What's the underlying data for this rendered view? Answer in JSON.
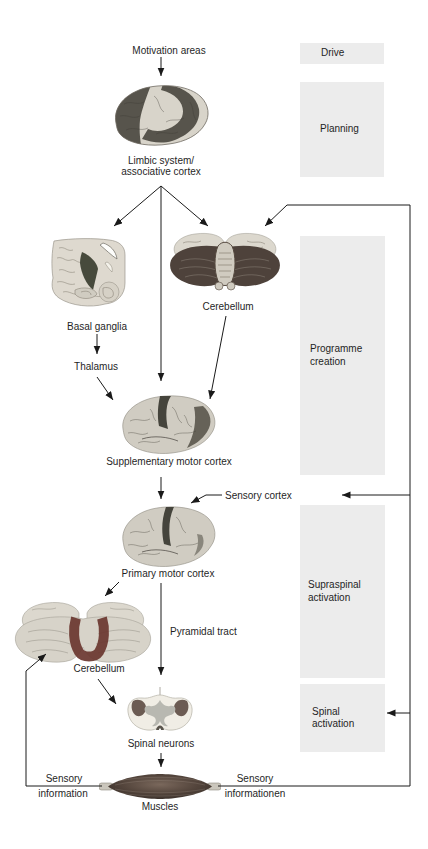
{
  "figure": {
    "stages": [
      {
        "id": "drive",
        "label": "Drive"
      },
      {
        "id": "planning",
        "label": "Planning"
      },
      {
        "id": "programme-creation",
        "label": "Programme\ncreation"
      },
      {
        "id": "supraspinal-activation",
        "label": "Supraspinal\nactivation"
      },
      {
        "id": "spinal-activation",
        "label": "Spinal\nactivation"
      }
    ],
    "labels": {
      "motivation_areas": "Motivation areas",
      "limbic": "Limbic system/\nassociative cortex",
      "basal_ganglia": "Basal ganglia",
      "thalamus": "Thalamus",
      "cerebellum_upper": "Cerebellum",
      "supplementary_motor_cortex": "Supplementary motor cortex",
      "sensory_cortex": "Sensory cortex",
      "primary_motor_cortex": "Primary motor cortex",
      "pyramidal_tract": "Pyramidal tract",
      "cerebellum_lower": "Cerebellum",
      "spinal_neurons": "Spinal neurons",
      "muscles": "Muscles",
      "sensory_left_line1": "Sensory",
      "sensory_left_line2": "information",
      "sensory_right_line1": "Sensory",
      "sensory_right_line2": "informationen"
    },
    "icons": [
      "limbic-brain-image",
      "basal-ganglia-image",
      "cerebellum-upper-image",
      "supplementary-motor-cortex-image",
      "primary-motor-cortex-image",
      "cerebellum-lower-image",
      "spinal-cord-section-image",
      "muscle-image",
      "arrow-connectors"
    ],
    "colors": {
      "background": "#ffffff",
      "stage_box": "#ececec",
      "text": "#1f1f1f",
      "line": "#1a1a1a",
      "brain_light": "#d4d0c6",
      "brain_dark": "#57544c",
      "cerebellum_dark": "#4e423b",
      "highlight_red": "#6a362f",
      "gray_matter": "#b8b8b1",
      "muscle_dark": "#54453c"
    }
  }
}
